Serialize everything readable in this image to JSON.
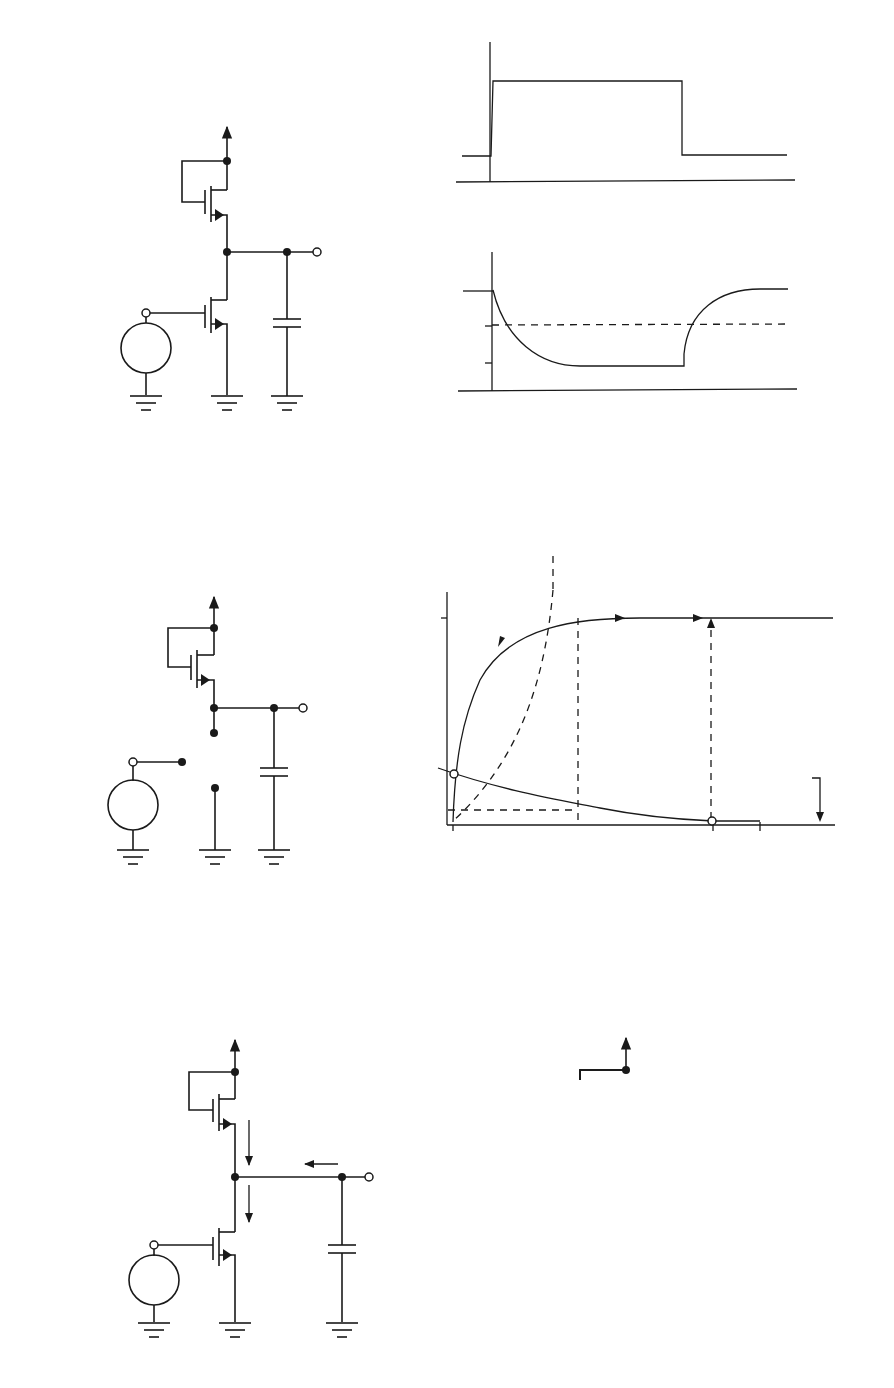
{
  "figure": {
    "panels": {
      "a": {
        "caption": "(a)",
        "vdd": {
          "main": "V",
          "sub": "DD"
        },
        "node1": "1",
        "node2": "2",
        "node3": "3",
        "m2": {
          "main": "M",
          "sub": "2"
        },
        "m1": {
          "main": "M",
          "sub": "1"
        },
        "vo": {
          "main": "v",
          "sub": "O"
        },
        "cl": {
          "main": "C",
          "sub": "L"
        },
        "vi": {
          "main": "v",
          "sub": "I"
        },
        "plus": "+",
        "minus": "–"
      },
      "b": {
        "caption": "(b)",
        "top": {
          "ylabel": {
            "main": "v",
            "sub": "I"
          },
          "voh": {
            "main": "V",
            "sub": "OH"
          },
          "vol": {
            "main": "V",
            "sub": "OL"
          },
          "zero": "0",
          "t": "t"
        },
        "bottom": {
          "ylabel": {
            "main": "v",
            "sub": "O"
          },
          "voh": {
            "main": "V",
            "sub": "OH"
          },
          "vm": {
            "main": "V",
            "sub": "M"
          },
          "vol": {
            "main": "V",
            "sub": "OL"
          },
          "zero": "0",
          "t": "t"
        }
      },
      "c": {
        "caption": "(c)",
        "vdd": {
          "main": "V",
          "sub": "DD"
        },
        "m2": {
          "main": "M",
          "sub": "2"
        },
        "vo": {
          "main": "v",
          "sub": "O"
        },
        "vcap": {
          "main": "V",
          "sub": "OH"
        },
        "vi_eq": {
          "main": "v",
          "sub": "I",
          "eq": " = V",
          "sub2": "OL"
        },
        "plus": "+",
        "minus": "–"
      },
      "d": {
        "caption": "(d)",
        "ylabel": {
          "main": "i",
          "sub": "D"
        },
        "xlabel": {
          "main": "v",
          "sub": "O"
        },
        "region_left": "Ohmic",
        "region_right": "Active",
        "ix": {
          "main": "I",
          "sub": "X"
        },
        "il": {
          "main": "I",
          "sub": "L"
        },
        "iy": {
          "main": "I",
          "sub": "Y"
        },
        "x_vol": {
          "main": "V",
          "sub": "OL"
        },
        "x_vm": {
          "main": "V",
          "sub": "M"
        },
        "x_voh": {
          "main": "V",
          "sub": "OH"
        },
        "x_vdd": {
          "main": "V",
          "sub": "DD"
        },
        "pt_a": "a",
        "pt_b": "b",
        "pt_c": "c",
        "curve_high": {
          "main": "v",
          "sub": "I",
          "eq": " = V",
          "sub2": "OH"
        },
        "curve_low": {
          "main": "v",
          "sub": "I",
          "eq": " = V",
          "sub2": "OL"
        }
      },
      "e": {
        "caption": "(e)",
        "vdd": {
          "main": "V",
          "sub": "DD"
        },
        "m2": {
          "main": "M",
          "sub": "2"
        },
        "m1": {
          "main": "M",
          "sub": "1"
        },
        "ia2": {
          "main": "I",
          "sub": "A2"
        },
        "ia1": {
          "main": "I",
          "sub": "A1"
        },
        "ic": {
          "main": "I",
          "sub": "C"
        },
        "vo": {
          "main": "v",
          "sub": "O"
        },
        "cl": {
          "main": "C",
          "sub": "L"
        },
        "vcap": {
          "main": "V",
          "sub": "OH"
        },
        "vi": {
          "main": "v",
          "sub": "I"
        },
        "plus": "+",
        "minus": "–"
      },
      "f": {
        "caption": "(f)",
        "vdd": {
          "main": "V",
          "sub": "DD"
        },
        "m2": {
          "main": "M",
          "sub": "2"
        },
        "id": {
          "main": "i",
          "sub": "D"
        },
        "vo": {
          "main": "v",
          "sub": "O"
        },
        "vcap": {
          "main": "V",
          "sub": "OL"
        },
        "vi_eq": {
          "main": "v",
          "sub": "I",
          "eq": " = V",
          "sub2": "OL"
        },
        "plus": "+",
        "minus": "–"
      }
    }
  }
}
